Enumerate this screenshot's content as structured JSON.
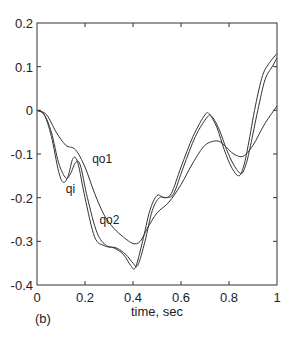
{
  "chart_data": {
    "type": "line",
    "title": "",
    "panel_label": "(b)",
    "xlabel": "time, sec",
    "ylabel": "",
    "xlim": [
      0,
      1
    ],
    "ylim": [
      -0.4,
      0.2
    ],
    "xticks": [
      "0",
      "0.2",
      "0.4",
      "0.6",
      "0.8",
      "1"
    ],
    "yticks": [
      "0.2",
      "0.1",
      "0",
      "-0.1",
      "-0.2",
      "-0.3",
      "-0.4"
    ],
    "grid": false,
    "series": [
      {
        "name": "qi",
        "x": [
          0,
          0.03,
          0.06,
          0.09,
          0.11,
          0.13,
          0.15,
          0.17,
          0.2,
          0.24,
          0.28,
          0.32,
          0.36,
          0.39,
          0.41,
          0.44,
          0.47,
          0.5,
          0.53,
          0.56,
          0.6,
          0.65,
          0.7,
          0.72,
          0.75,
          0.78,
          0.81,
          0.84,
          0.86,
          0.88,
          0.91,
          0.94,
          0.97,
          1.0
        ],
        "y": [
          0,
          -0.01,
          -0.06,
          -0.14,
          -0.165,
          -0.15,
          -0.11,
          -0.12,
          -0.2,
          -0.29,
          -0.31,
          -0.315,
          -0.33,
          -0.355,
          -0.36,
          -0.3,
          -0.23,
          -0.195,
          -0.2,
          -0.19,
          -0.13,
          -0.06,
          -0.01,
          -0.01,
          -0.04,
          -0.09,
          -0.13,
          -0.15,
          -0.13,
          -0.08,
          0.01,
          0.08,
          0.11,
          0.13
        ]
      },
      {
        "name": "qo2",
        "x": [
          0,
          0.03,
          0.06,
          0.09,
          0.12,
          0.14,
          0.16,
          0.18,
          0.21,
          0.25,
          0.29,
          0.33,
          0.37,
          0.4,
          0.42,
          0.45,
          0.48,
          0.51,
          0.54,
          0.57,
          0.61,
          0.66,
          0.71,
          0.73,
          0.76,
          0.79,
          0.82,
          0.85,
          0.87,
          0.89,
          0.92,
          0.95,
          0.98,
          1.0
        ],
        "y": [
          0,
          -0.01,
          -0.05,
          -0.12,
          -0.155,
          -0.145,
          -0.12,
          -0.125,
          -0.2,
          -0.28,
          -0.31,
          -0.315,
          -0.33,
          -0.35,
          -0.355,
          -0.3,
          -0.23,
          -0.2,
          -0.2,
          -0.19,
          -0.13,
          -0.06,
          -0.015,
          -0.015,
          -0.045,
          -0.09,
          -0.125,
          -0.145,
          -0.125,
          -0.08,
          0.0,
          0.07,
          0.1,
          0.12
        ]
      },
      {
        "name": "qo1",
        "x": [
          0,
          0.04,
          0.08,
          0.12,
          0.16,
          0.2,
          0.24,
          0.28,
          0.32,
          0.36,
          0.4,
          0.43,
          0.46,
          0.5,
          0.55,
          0.6,
          0.65,
          0.7,
          0.75,
          0.78,
          0.82,
          0.86,
          0.9,
          0.95,
          1.0
        ],
        "y": [
          0,
          -0.01,
          -0.05,
          -0.08,
          -0.09,
          -0.13,
          -0.19,
          -0.24,
          -0.27,
          -0.29,
          -0.305,
          -0.3,
          -0.27,
          -0.235,
          -0.21,
          -0.17,
          -0.12,
          -0.08,
          -0.07,
          -0.08,
          -0.1,
          -0.105,
          -0.08,
          -0.03,
          0.01
        ]
      }
    ],
    "annotations": [
      {
        "text": "qo1",
        "x": 0.23,
        "y": -0.12
      },
      {
        "text": "qi",
        "x": 0.12,
        "y": -0.19
      },
      {
        "text": "qo2",
        "x": 0.26,
        "y": -0.26
      }
    ]
  }
}
